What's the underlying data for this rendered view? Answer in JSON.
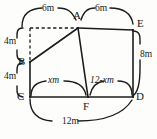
{
  "figure": {
    "type": "geometry-diagram",
    "vertices": [
      {
        "name": "A",
        "x": 78,
        "y": 28,
        "label_x": 74,
        "label_y": 14
      },
      {
        "name": "B",
        "x": 30,
        "y": 62,
        "label_x": 18,
        "label_y": 57
      },
      {
        "name": "C",
        "x": 30,
        "y": 97,
        "label_x": 17,
        "label_y": 97
      },
      {
        "name": "D",
        "x": 133,
        "y": 97,
        "label_x": 137,
        "label_y": 97
      },
      {
        "name": "E",
        "x": 133,
        "y": 30,
        "label_x": 137,
        "label_y": 22
      },
      {
        "name": "F",
        "x": 88,
        "y": 97,
        "label_x": 84,
        "label_y": 110
      }
    ],
    "edges": [
      {
        "from": "A",
        "to": "B",
        "style": "solid"
      },
      {
        "from": "B",
        "to": "C",
        "style": "solid"
      },
      {
        "from": "C",
        "to": "D",
        "style": "solid"
      },
      {
        "from": "D",
        "to": "E",
        "style": "solid"
      },
      {
        "from": "E",
        "to": "A",
        "style": "solid"
      },
      {
        "from": "A",
        "to": "F",
        "style": "solid"
      }
    ],
    "construction_line": {
      "style": "dashed",
      "from_x": 30,
      "from_y": 28,
      "to_x": 78,
      "to_y": 28
    },
    "dimensions": [
      {
        "id": "top-left",
        "text": "6m",
        "x": 40,
        "y": 9,
        "italic": false
      },
      {
        "id": "top-right",
        "text": "6m",
        "x": 97,
        "y": 9,
        "italic": false
      },
      {
        "id": "left-upper",
        "text": "4m",
        "x": 6,
        "y": 41,
        "italic": false
      },
      {
        "id": "left-lower",
        "text": "4m",
        "x": 6,
        "y": 76,
        "italic": false
      },
      {
        "id": "right",
        "text": "8m",
        "x": 139,
        "y": 58,
        "italic": false
      },
      {
        "id": "bottom-left",
        "text": "xm",
        "x": 53,
        "y": 82,
        "italic": true
      },
      {
        "id": "bottom-right",
        "text": "12-xm",
        "x": 92,
        "y": 82,
        "italic": true
      },
      {
        "id": "bottom",
        "text": "12m",
        "x": 65,
        "y": 122,
        "italic": false
      }
    ]
  }
}
